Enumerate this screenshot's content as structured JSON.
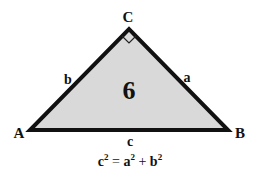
{
  "diagram": {
    "type": "right-triangle",
    "fill_color": "#d9d9d9",
    "stroke_color": "#111111",
    "vertices": {
      "A": {
        "label": "A",
        "x": 30,
        "y": 130
      },
      "B": {
        "label": "B",
        "x": 228,
        "y": 130
      },
      "C": {
        "label": "C",
        "x": 129,
        "y": 29
      }
    },
    "sides": {
      "a": "a",
      "b": "b",
      "c": "c"
    },
    "center_label": "6",
    "right_angle_at": "C",
    "equation": {
      "c": "c",
      "exp": "2",
      "eq": " = ",
      "a": "a",
      "plus": " + ",
      "b": "b"
    }
  }
}
